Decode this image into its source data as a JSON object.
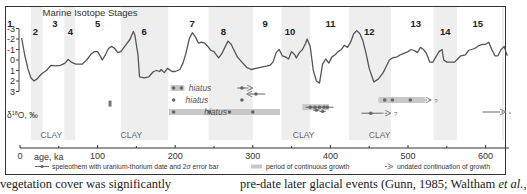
{
  "chart_data": {
    "type": "line",
    "title": "Marine Isotope Stages",
    "xlabel": "age, ka",
    "ylabel": "δ18O, ‰",
    "xlim": [
      0,
      630
    ],
    "ylim": [
      -3,
      3
    ],
    "y_inverted": true,
    "x_ticks": [
      0,
      100,
      200,
      300,
      400,
      500,
      600
    ],
    "x_minor_ticks": [
      50,
      150,
      250,
      350,
      450,
      550
    ],
    "y_ticks": [
      -3,
      -2,
      -1,
      0,
      1,
      2,
      3
    ],
    "grid": false,
    "stage_labels": [
      {
        "label": "1",
        "x": 5,
        "row": "high"
      },
      {
        "label": "2",
        "x": 20,
        "row": "low"
      },
      {
        "label": "3",
        "x": 45,
        "row": "high"
      },
      {
        "label": "4",
        "x": 65,
        "row": "low"
      },
      {
        "label": "5",
        "x": 100,
        "row": "high"
      },
      {
        "label": "6",
        "x": 160,
        "row": "low"
      },
      {
        "label": "7",
        "x": 222,
        "row": "high"
      },
      {
        "label": "8",
        "x": 262,
        "row": "low"
      },
      {
        "label": "9",
        "x": 316,
        "row": "high"
      },
      {
        "label": "10",
        "x": 348,
        "row": "low"
      },
      {
        "label": "11",
        "x": 400,
        "row": "high"
      },
      {
        "label": "12",
        "x": 450,
        "row": "low"
      },
      {
        "label": "13",
        "x": 510,
        "row": "high"
      },
      {
        "label": "14",
        "x": 548,
        "row": "low"
      },
      {
        "label": "15",
        "x": 590,
        "row": "high"
      }
    ],
    "glacial_bands_ka": [
      [
        14,
        29
      ],
      [
        57,
        71
      ],
      [
        130,
        191
      ],
      [
        243,
        300
      ],
      [
        337,
        374
      ],
      [
        424,
        478
      ],
      [
        533,
        563
      ],
      [
        621,
        630
      ]
    ],
    "series": [
      {
        "name": "δ18O",
        "points": [
          [
            2,
            -2.1
          ],
          [
            6,
            -0.5
          ],
          [
            10,
            0.8
          ],
          [
            14,
            1.7
          ],
          [
            18,
            2.0
          ],
          [
            22,
            1.8
          ],
          [
            28,
            1.3
          ],
          [
            34,
            1.0
          ],
          [
            40,
            0.5
          ],
          [
            46,
            0.55
          ],
          [
            52,
            0.5
          ],
          [
            58,
            0.3
          ],
          [
            62,
            -0.05
          ],
          [
            66,
            0.2
          ],
          [
            72,
            0.4
          ],
          [
            80,
            0.4
          ],
          [
            86,
            0.0
          ],
          [
            92,
            -0.6
          ],
          [
            96,
            -0.8
          ],
          [
            100,
            -0.8
          ],
          [
            104,
            -0.3
          ],
          [
            106,
            0.0
          ],
          [
            110,
            -0.5
          ],
          [
            114,
            -1.1
          ],
          [
            118,
            -1.3
          ],
          [
            122,
            -1.1
          ],
          [
            126,
            -0.7
          ],
          [
            130,
            -0.8
          ],
          [
            136,
            -1.4
          ],
          [
            142,
            -2.0
          ],
          [
            146,
            -2.7
          ],
          [
            148,
            -2.4
          ],
          [
            152,
            -0.5
          ],
          [
            154,
            1.6
          ],
          [
            160,
            1.7
          ],
          [
            166,
            1.6
          ],
          [
            172,
            1.1
          ],
          [
            176,
            1.0
          ],
          [
            180,
            1.1
          ],
          [
            182,
            0.9
          ],
          [
            186,
            1.2
          ],
          [
            190,
            0.8
          ],
          [
            196,
            1.1
          ],
          [
            200,
            1.1
          ],
          [
            206,
            0.9
          ],
          [
            210,
            0.3
          ],
          [
            214,
            -0.7
          ],
          [
            218,
            -2.0
          ],
          [
            222,
            -2.6
          ],
          [
            226,
            -2.2
          ],
          [
            230,
            -1.6
          ],
          [
            234,
            -1.7
          ],
          [
            238,
            -1.6
          ],
          [
            242,
            -1.3
          ],
          [
            246,
            -0.9
          ],
          [
            250,
            -0.8
          ],
          [
            254,
            -0.4
          ],
          [
            256,
            -0.2
          ],
          [
            260,
            -0.6
          ],
          [
            264,
            -1.2
          ],
          [
            268,
            -1.8
          ],
          [
            272,
            -1.5
          ],
          [
            276,
            -0.9
          ],
          [
            280,
            -0.3
          ],
          [
            286,
            0.2
          ],
          [
            292,
            0.7
          ],
          [
            298,
            0.9
          ],
          [
            304,
            0.8
          ],
          [
            310,
            0.7
          ],
          [
            316,
            0.6
          ],
          [
            322,
            0.5
          ],
          [
            326,
            0.2
          ],
          [
            330,
            -0.7
          ],
          [
            334,
            -1.0
          ],
          [
            338,
            -0.4
          ],
          [
            342,
            -0.3
          ],
          [
            346,
            -0.1
          ],
          [
            350,
            -0.8
          ],
          [
            354,
            -0.5
          ],
          [
            356,
            -0.2
          ],
          [
            360,
            -0.7
          ],
          [
            364,
            -1.0
          ],
          [
            368,
            -1.6
          ],
          [
            370,
            -2.0
          ],
          [
            374,
            -1.3
          ],
          [
            378,
            1.0
          ],
          [
            382,
            2.0
          ],
          [
            386,
            2.2
          ],
          [
            390,
            0.4
          ],
          [
            394,
            -0.1
          ],
          [
            398,
            0.3
          ],
          [
            402,
            -0.3
          ],
          [
            406,
            -0.5
          ],
          [
            410,
            -0.8
          ],
          [
            414,
            -1.0
          ],
          [
            418,
            -1.4
          ],
          [
            422,
            -1.2
          ],
          [
            426,
            -1.7
          ],
          [
            430,
            -2.5
          ],
          [
            434,
            -2.8
          ],
          [
            438,
            -2.5
          ],
          [
            442,
            -1.8
          ],
          [
            446,
            -0.6
          ],
          [
            450,
            0.8
          ],
          [
            456,
            2.1
          ],
          [
            462,
            1.8
          ],
          [
            468,
            1.2
          ],
          [
            472,
            0.6
          ],
          [
            476,
            0.0
          ],
          [
            480,
            -0.2
          ],
          [
            486,
            -0.3
          ],
          [
            490,
            -0.5
          ],
          [
            494,
            -0.6
          ],
          [
            500,
            -0.8
          ],
          [
            504,
            -1.0
          ],
          [
            508,
            -0.9
          ],
          [
            512,
            -0.7
          ],
          [
            516,
            -1.2
          ],
          [
            520,
            -1.0
          ],
          [
            524,
            -0.6
          ],
          [
            528,
            0.2
          ],
          [
            532,
            0.2
          ],
          [
            536,
            -0.3
          ],
          [
            540,
            -0.8
          ],
          [
            544,
            -1.0
          ],
          [
            546,
            0.0
          ],
          [
            550,
            0.2
          ],
          [
            556,
            0.2
          ],
          [
            560,
            0.2
          ],
          [
            564,
            -0.1
          ],
          [
            568,
            -0.4
          ],
          [
            574,
            -0.5
          ],
          [
            578,
            -0.9
          ],
          [
            582,
            -1.0
          ],
          [
            586,
            -1.1
          ],
          [
            592,
            -1.4
          ],
          [
            596,
            -1.5
          ],
          [
            600,
            -1.5
          ],
          [
            604,
            -1.7
          ],
          [
            608,
            -1.0
          ],
          [
            612,
            -0.4
          ],
          [
            616,
            -0.4
          ],
          [
            620,
            -1.0
          ],
          [
            624,
            -1.3
          ],
          [
            626,
            -0.8
          ],
          [
            628,
            -0.4
          ]
        ]
      }
    ],
    "speleothems": [
      {
        "y_row": 1,
        "bars": [
          [
            194,
            212
          ]
        ],
        "points": [
          198,
          208
        ],
        "label": "hiatus",
        "label_x": 232
      },
      {
        "y_row": 1,
        "points": [
          286
        ],
        "error": [
          280,
          292
        ],
        "arrow_to": 300,
        "arrow_dir": "right"
      },
      {
        "y_row": 1.5,
        "points": [
          304
        ],
        "error": [
          296,
          316
        ],
        "arrow_to": 292,
        "arrow_dir": "left"
      },
      {
        "y_row": 2,
        "points": [
          198,
          286
        ],
        "label": "hiatus",
        "label_x": 228
      },
      {
        "y_row": 3,
        "bars": [
          [
            192,
            335
          ]
        ],
        "points": [
          198,
          244,
          270,
          300
        ],
        "label": "hiatus",
        "label_x": 252
      },
      {
        "y_row": 2.3,
        "points": [
          116
        ],
        "mark": "small-block"
      },
      {
        "y_row": 2.6,
        "bars": [
          [
            364,
            398
          ]
        ],
        "points": [
          374,
          380,
          386,
          392,
          396
        ],
        "error": [
          368,
          404
        ]
      },
      {
        "y_row": 2.0,
        "bars": [
          [
            462,
            522
          ]
        ],
        "points": [
          470,
          480,
          503
        ],
        "arrow_to": 530,
        "arrow_dir": "right",
        "suffix": "?"
      },
      {
        "y_row": 3.1,
        "points": [
          452
        ],
        "error": [
          440,
          466
        ],
        "arrow_to": 478,
        "arrow_dir": "right",
        "suffix": "?"
      },
      {
        "y_row": 3.0,
        "points": [],
        "error": [
          596,
          616
        ],
        "arrow_to": 626,
        "arrow_dir": "right",
        "suffix": "≈"
      }
    ],
    "clay_labels_ka": [
      25,
      128,
      350,
      448
    ],
    "annotations": [
      "hiatus",
      "hiatus",
      "hiatus",
      "CLAY",
      "CLAY",
      "CLAY",
      "CLAY"
    ]
  },
  "figure": {
    "title": "Marine Isotope Stages",
    "y_axis_label": "δ¹⁸O, ‰",
    "x_axis_label": "age, ka",
    "clay_label": "CLAY",
    "hiatus_label": "hiatus",
    "question_mark": "?",
    "approx_mark": "≈"
  },
  "legend": {
    "items": [
      {
        "icon": "dated-speleothem-symbol",
        "label": "speleothem with uranium-thorium date and 2σ error bar"
      },
      {
        "icon": "grey-bar-symbol",
        "label": "period of continuous growth"
      },
      {
        "icon": "dashed-arrow-symbol",
        "label": "undated continuation of growth"
      }
    ]
  },
  "body_text": {
    "left": "vegetation cover was significantly",
    "right_prefix": "pre-date later glacial events (Gunn, 1985; Waltham ",
    "right_italic": "et al.",
    "right_suffix": ","
  },
  "colors": {
    "curve": "#555555",
    "band": "#eeeeee",
    "bar": "#c8c8c8",
    "point": "#666666",
    "text": "#333333"
  }
}
